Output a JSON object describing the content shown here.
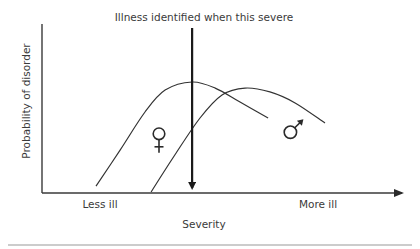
{
  "chart_data": {
    "type": "line",
    "title": "Illness identified when this severe",
    "xlabel": "Severity",
    "ylabel": "Probability of disorder",
    "x_tick_labels": [
      {
        "label": "Less ill",
        "x": 16
      },
      {
        "label": "More ill",
        "x": 77
      }
    ],
    "xlim": [
      0,
      100
    ],
    "ylim": [
      0,
      100
    ],
    "grid": false,
    "legend": "none (series marked by in-plot symbols)",
    "threshold": {
      "x": 41.7,
      "label": "Illness identified when this severe",
      "direction": "down"
    },
    "series": [
      {
        "name": "Female",
        "symbol": "♀",
        "symbol_at": {
          "x": 32.5,
          "y": 35
        },
        "x": [
          15,
          21.7,
          28.6,
          34.2,
          41.7,
          48.1,
          55,
          62.8
        ],
        "y": [
          4.1,
          25.4,
          47.9,
          60.9,
          65.7,
          62.1,
          53.8,
          44.4
        ]
      },
      {
        "name": "Male",
        "symbol": "♂",
        "symbol_at": {
          "x": 69,
          "y": 36
        },
        "x": [
          30.3,
          36.9,
          43.9,
          50,
          56.4,
          63.3,
          70.3,
          78.6
        ],
        "y": [
          0.6,
          22.5,
          44.4,
          58,
          62.1,
          59.8,
          53.3,
          41.4
        ]
      }
    ]
  }
}
